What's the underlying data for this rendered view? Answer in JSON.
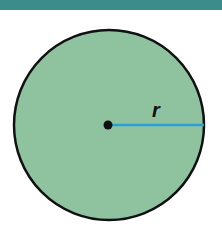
{
  "diagram": {
    "label": "r",
    "colors": {
      "band": "#3c8c8c",
      "fill": "#8fc3a0",
      "outline": "#111111",
      "radius_line": "#2a9fd6",
      "center_dot": "#111111"
    }
  }
}
